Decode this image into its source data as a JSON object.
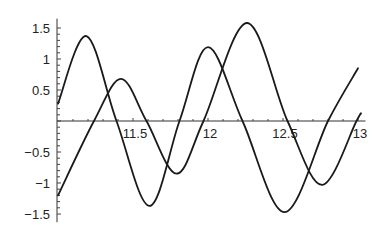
{
  "chart_data": {
    "type": "line",
    "title": "",
    "xlabel": "",
    "ylabel": "",
    "xlim": [
      11.0,
      13.05
    ],
    "ylim": [
      -1.6,
      1.65
    ],
    "grid": false,
    "legend": null,
    "x_ticks": [
      11.5,
      12,
      12.5,
      13
    ],
    "x_tick_labels": [
      "11.5",
      "12",
      "12.5",
      "13"
    ],
    "y_ticks": [
      1.5,
      1,
      0.5,
      -0.5,
      -1,
      -1.5
    ],
    "y_tick_labels": [
      "1.5",
      "1",
      "0.5",
      "-0.5",
      "-1",
      "-1.5"
    ],
    "series": [
      {
        "name": "curve-1",
        "color": "#1a1a1a",
        "points": [
          [
            11.0,
            0.28
          ],
          [
            11.19,
            1.37
          ],
          [
            11.39,
            0.0
          ],
          [
            11.61,
            -1.37
          ],
          [
            11.81,
            0.0
          ],
          [
            12.0,
            1.19
          ],
          [
            12.23,
            0.0
          ],
          [
            12.51,
            -1.47
          ],
          [
            12.8,
            0.0
          ],
          [
            13.0,
            0.85
          ]
        ]
      },
      {
        "name": "curve-2",
        "color": "#1a1a1a",
        "points": [
          [
            11.0,
            -1.2
          ],
          [
            11.24,
            0.0
          ],
          [
            11.42,
            0.68
          ],
          [
            11.59,
            0.0
          ],
          [
            11.79,
            -0.85
          ],
          [
            11.97,
            0.0
          ],
          [
            12.26,
            1.58
          ],
          [
            12.53,
            0.0
          ],
          [
            12.76,
            -1.03
          ],
          [
            12.99,
            0.0
          ],
          [
            13.02,
            0.12
          ]
        ]
      }
    ]
  }
}
